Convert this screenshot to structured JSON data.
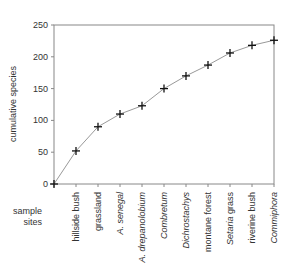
{
  "chart_data": {
    "type": "line",
    "title": "",
    "xlabel": "sample sites",
    "ylabel": "cumulative species",
    "ylim": [
      0,
      250
    ],
    "yticks": [
      0,
      50,
      100,
      150,
      200,
      250
    ],
    "grid": false,
    "legend": null,
    "marker": "plus",
    "categories": [
      {
        "label": "",
        "italic_part": ""
      },
      {
        "label": "hillside bush",
        "italic_part": ""
      },
      {
        "label": "grassland",
        "italic_part": ""
      },
      {
        "label": "A. senegal",
        "italic_part": "A. senegal"
      },
      {
        "label": "A. drepanolobium",
        "italic_part": "A. drepanolobium"
      },
      {
        "label": "Combretum",
        "italic_part": "Combretum"
      },
      {
        "label": "Dichrostachys",
        "italic_part": "Dichrostachys"
      },
      {
        "label": "montane forest",
        "italic_part": ""
      },
      {
        "label": "Setaria grass",
        "italic_part": "Setaria"
      },
      {
        "label": "riverine bush",
        "italic_part": ""
      },
      {
        "label": "Commiphora",
        "italic_part": "Commiphora"
      }
    ],
    "series": [
      {
        "name": "cumulative species",
        "values": [
          0,
          52,
          90,
          110,
          123,
          150,
          170,
          187,
          206,
          218,
          226
        ]
      }
    ]
  },
  "colors": {
    "axis": "#888888",
    "line": "#999999",
    "marker": "#111111",
    "text": "#333333"
  }
}
